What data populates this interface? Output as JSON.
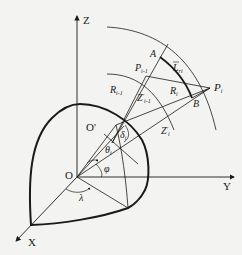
{
  "diagram": {
    "type": "geometric-3d-coordinate-diagram",
    "axes": {
      "z_label": "Z",
      "y_label": "Y",
      "x_label": "X",
      "origin_label": "O"
    },
    "points": {
      "o_prime": "O'",
      "a": "A",
      "b": "B",
      "p_prev": "P",
      "p_prev_sub": "i-1",
      "p_i": "P",
      "p_i_sub": "i"
    },
    "segments": {
      "r_prev": "R",
      "r_prev_sub": "i-1",
      "r_i": "R",
      "r_i_sub": "i",
      "z_prev": "Z",
      "z_prev_prime": "'",
      "z_prev_sub": "i-1",
      "z_i": "Z",
      "z_i_prime": "'",
      "z_i_sub": "i",
      "arc_l": "L",
      "arc_l_sub": "ri"
    },
    "angles": {
      "delta": "δ",
      "delta_sub": "i",
      "theta": "θ",
      "theta_sub": "i",
      "phi": "φ",
      "lambda": "λ"
    }
  }
}
